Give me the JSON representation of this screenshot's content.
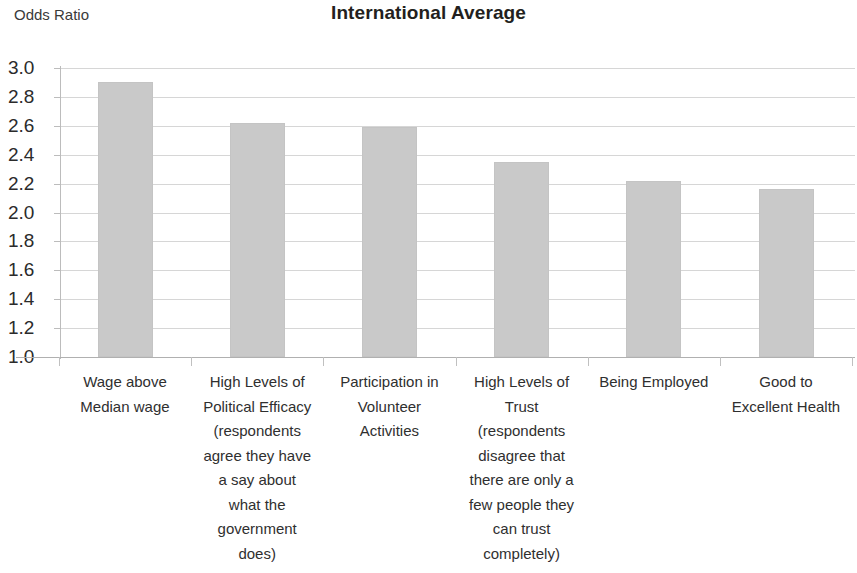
{
  "chart_data": {
    "type": "bar",
    "title": "International Average",
    "xlabel": "",
    "ylabel": "Odds Ratio",
    "ylim": [
      1.0,
      3.0
    ],
    "grid": true,
    "legend": "none",
    "y_ticks": [
      "3.0",
      "2.8",
      "2.6",
      "2.4",
      "2.2",
      "2.0",
      "1.8",
      "1.6",
      "1.4",
      "1.2",
      "1.0"
    ],
    "categories": [
      "Wage above Median wage",
      "High Levels of Political Efficacy (respondents agree they have a say about what the government does)",
      "Participation in Volunteer Activities",
      "High Levels of Trust (respondents disagree that there are only a few people they can trust completely)",
      "Being Employed",
      "Good to Excellent Health"
    ],
    "values": [
      2.9,
      2.62,
      2.59,
      2.35,
      2.22,
      2.16
    ],
    "bar_color": "#c9c9c9",
    "gridline_color": "#d6d6d6"
  },
  "axis": {
    "y_caption": "Odds Ratio"
  },
  "labels": {
    "cat0_line0": "Wage above",
    "cat0_line1": "Median wage",
    "cat1_line0": "High Levels of",
    "cat1_line1": "Political Efficacy",
    "cat1_line2": "(respondents",
    "cat1_line3": "agree they have",
    "cat1_line4": "a say about",
    "cat1_line5": "what the",
    "cat1_line6": "government",
    "cat1_line7": "does)",
    "cat2_line0": "Participation in",
    "cat2_line1": "Volunteer",
    "cat2_line2": "Activities",
    "cat3_line0": "High Levels of",
    "cat3_line1": "Trust",
    "cat3_line2": "(respondents",
    "cat3_line3": "disagree that",
    "cat3_line4": "there are only a",
    "cat3_line5": "few people they",
    "cat3_line6": "can trust",
    "cat3_line7": "completely)",
    "cat4_line0": "Being Employed",
    "cat5_line0": "Good to",
    "cat5_line1": "Excellent Health"
  }
}
